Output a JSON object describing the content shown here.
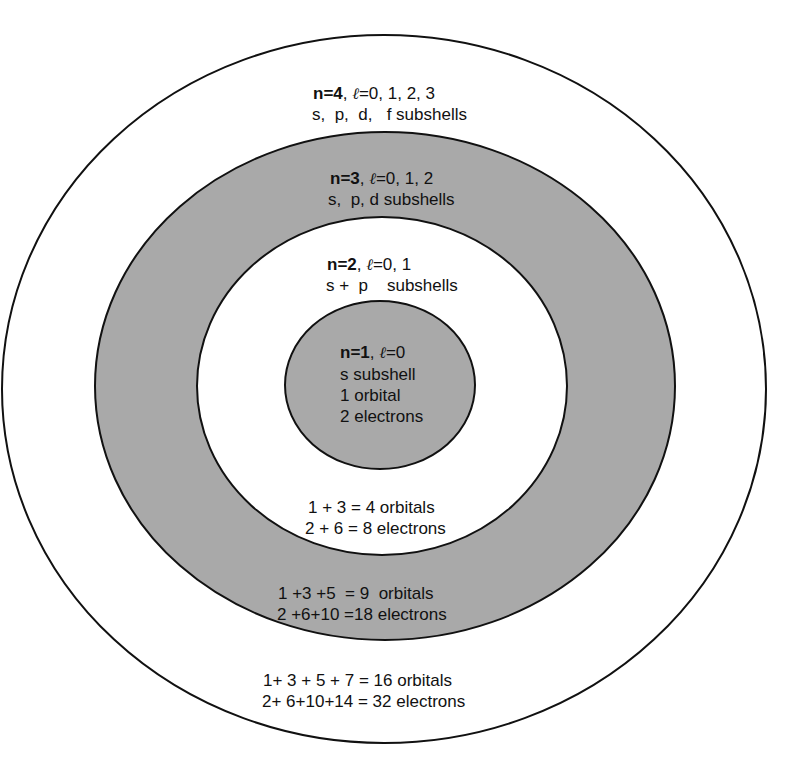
{
  "diagram": {
    "colors": {
      "shaded": "#a9a9a9",
      "unshaded": "#ffffff",
      "stroke": "#111111"
    },
    "shells": [
      {
        "n_label": "n=4",
        "l_values": "=0, 1, 2, 3",
        "subshells": "s,  p,  d,   f subshells",
        "orbitals": "1+ 3 + 5 + 7 = 16 orbitals",
        "electrons": "2+ 6+10+14 = 32 electrons",
        "fill": "white"
      },
      {
        "n_label": "n=3",
        "l_values": "=0, 1, 2",
        "subshells": "s,  p, d subshells",
        "orbitals": "1 +3 +5  = 9  orbitals",
        "electrons": "2 +6+10 =18 electrons",
        "fill": "gray"
      },
      {
        "n_label": "n=2",
        "l_values": "=0, 1",
        "subshells": "s +  p    subshells",
        "orbitals": "1 + 3 = 4 orbitals",
        "electrons": "2 + 6 = 8 electrons",
        "fill": "white"
      },
      {
        "n_label": "n=1",
        "l_values": "=0",
        "subshells": "s subshell",
        "orbitals": "1 orbital",
        "electrons": "2 electrons",
        "fill": "gray"
      }
    ],
    "ell_symbol": "ℓ",
    "separator": ", "
  }
}
